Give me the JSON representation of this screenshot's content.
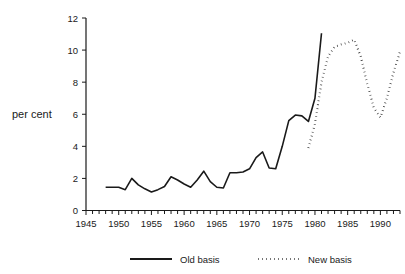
{
  "chart_data": {
    "type": "line",
    "title": "",
    "subtitle": "",
    "xlabel": "",
    "ylabel": "per cent",
    "xlim": [
      1945,
      1993
    ],
    "ylim": [
      0,
      12
    ],
    "grid": false,
    "legend_position": "bottom",
    "y_ticks": [
      "0",
      "2",
      "4",
      "6",
      "8",
      "10",
      "12"
    ],
    "y_tick_values": [
      0,
      2,
      4,
      6,
      8,
      10,
      12
    ],
    "y_minor_tick_step": 2,
    "x_ticks": [
      "1945",
      "1950",
      "1955",
      "1960",
      "1965",
      "1970",
      "1975",
      "1980",
      "1985",
      "1990"
    ],
    "x_tick_values": [
      1945,
      1950,
      1955,
      1960,
      1965,
      1970,
      1975,
      1980,
      1985,
      1990
    ],
    "x_minor_tick_step": 1,
    "series": [
      {
        "name": "Old basis",
        "style": "solid",
        "color": "#1a1a1a",
        "x": [
          1948,
          1949,
          1950,
          1951,
          1952,
          1953,
          1954,
          1955,
          1956,
          1957,
          1958,
          1959,
          1960,
          1961,
          1962,
          1963,
          1964,
          1965,
          1966,
          1967,
          1968,
          1969,
          1970,
          1971,
          1972,
          1973,
          1974,
          1975,
          1976,
          1977,
          1978,
          1979,
          1980,
          1981
        ],
        "values": [
          1.45,
          1.45,
          1.45,
          1.3,
          2.0,
          1.6,
          1.35,
          1.15,
          1.3,
          1.5,
          2.1,
          1.9,
          1.65,
          1.45,
          1.9,
          2.45,
          1.8,
          1.45,
          1.4,
          2.35,
          2.35,
          2.4,
          2.6,
          3.3,
          3.65,
          2.65,
          2.6,
          4.0,
          5.6,
          5.95,
          5.9,
          5.55,
          7.0,
          11.05
        ]
      },
      {
        "name": "New basis",
        "style": "dotted",
        "color": "#1a1a1a",
        "x": [
          1979,
          1980,
          1981,
          1982,
          1983,
          1984,
          1985,
          1986,
          1987,
          1988,
          1989,
          1990,
          1991,
          1992,
          1993
        ],
        "values": [
          3.9,
          5.4,
          8.0,
          9.6,
          10.2,
          10.35,
          10.45,
          10.65,
          9.6,
          7.9,
          6.4,
          5.8,
          7.0,
          8.6,
          9.9
        ]
      }
    ]
  },
  "legend": {
    "items": [
      {
        "label": "Old basis",
        "style": "solid"
      },
      {
        "label": "New basis",
        "style": "dotted"
      }
    ]
  }
}
